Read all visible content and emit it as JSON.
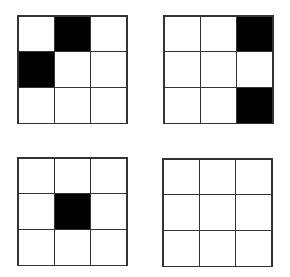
{
  "diagram": {
    "fill_color": "#000000",
    "empty_color": "#ffffff",
    "grids": [
      {
        "id": "top-left",
        "cells": [
          0,
          1,
          0,
          1,
          0,
          0,
          0,
          0,
          0
        ]
      },
      {
        "id": "top-right",
        "cells": [
          0,
          0,
          1,
          0,
          0,
          0,
          0,
          0,
          1
        ]
      },
      {
        "id": "bottom-left",
        "cells": [
          0,
          0,
          0,
          0,
          1,
          0,
          0,
          0,
          0
        ]
      },
      {
        "id": "bottom-right",
        "cells": [
          0,
          0,
          0,
          0,
          0,
          0,
          0,
          0,
          0
        ]
      }
    ]
  }
}
